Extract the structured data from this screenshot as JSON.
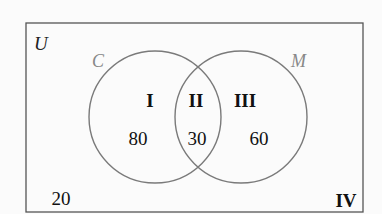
{
  "diagram": {
    "type": "venn",
    "universe_label": "U",
    "sets": [
      {
        "label": "C"
      },
      {
        "label": "M"
      }
    ],
    "regions": [
      {
        "label": "I",
        "value": "80"
      },
      {
        "label": "II",
        "value": "30"
      },
      {
        "label": "III",
        "value": "60"
      },
      {
        "label": "IV",
        "value": "20"
      }
    ],
    "colors": {
      "border": "#555555",
      "circle": "#7a7a7a",
      "set_label": "#7a7a7a",
      "text": "#111111"
    }
  }
}
